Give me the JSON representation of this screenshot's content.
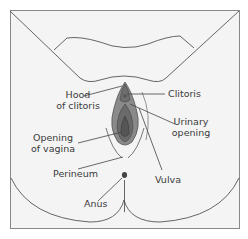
{
  "diagram": {
    "colors": {
      "background": "#f4f4f4",
      "outline": "#555555",
      "labia_outer": "#8a8a8a",
      "labia_mid": "#6e6e6e",
      "vaginal_opening": "#5a5a5a",
      "anus": "#444444",
      "text": "#3a3a3a"
    },
    "labels": {
      "hood_of_clitoris": {
        "line1": "Hood",
        "line2": "of clitoris"
      },
      "clitoris": {
        "line1": "Clitoris"
      },
      "urinary_opening": {
        "line1": "Urinary",
        "line2": "opening"
      },
      "opening_of_vagina": {
        "line1": "Opening",
        "line2": "of vagina"
      },
      "perineum": {
        "line1": "Perineum"
      },
      "vulva": {
        "line1": "Vulva"
      },
      "anus": {
        "line1": "Anus"
      }
    }
  }
}
